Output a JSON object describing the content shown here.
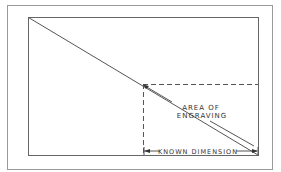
{
  "diagram": {
    "labels": {
      "area_line1": "AREA OF",
      "area_line2": "ENGRAVING",
      "known_dimension": "KNOWN DIMENSION"
    },
    "colors": {
      "line": "#555555",
      "outer_border": "#888888",
      "background": "#ffffff"
    }
  }
}
